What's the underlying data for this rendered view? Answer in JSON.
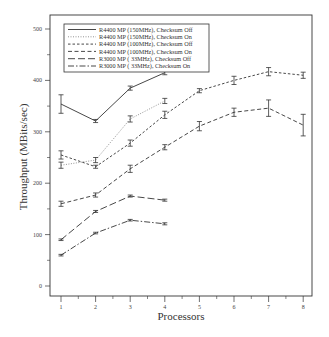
{
  "chart_data": {
    "type": "line",
    "title": "",
    "xlabel": "Processors",
    "ylabel": "Throughput (MBits/sec)",
    "x": [
      1,
      2,
      3,
      4,
      5,
      6,
      7,
      8
    ],
    "xlim": [
      0.8,
      8.2
    ],
    "ylim": [
      -20,
      520
    ],
    "yticks": [
      0,
      100,
      200,
      300,
      400,
      500
    ],
    "xticks": [
      1,
      2,
      3,
      4,
      5,
      6,
      7,
      8
    ],
    "grid": false,
    "legend_position": "upper left",
    "error_bars": true,
    "series": [
      {
        "name": "R4400 MP (150MHz), Checksum Off",
        "style": "solid",
        "x": [
          1,
          2,
          3,
          4
        ],
        "values": [
          354,
          321,
          385,
          415
        ],
        "err": [
          18,
          3,
          4,
          4
        ]
      },
      {
        "name": "R4400 MP (150MHz), Checksum On",
        "style": "dotted",
        "x": [
          1,
          2,
          3,
          4
        ],
        "values": [
          235,
          245,
          325,
          360
        ],
        "err": [
          6,
          5,
          6,
          5
        ]
      },
      {
        "name": "R4400 MP (100MHz), Checksum Off",
        "style": "short-dash",
        "x": [
          1,
          2,
          3,
          4,
          5,
          6,
          7,
          8
        ],
        "values": [
          255,
          232,
          278,
          333,
          380,
          400,
          417,
          410
        ],
        "err": [
          8,
          3,
          6,
          7,
          4,
          8,
          8,
          6
        ]
      },
      {
        "name": "R4400 MP (100MHz), Checksum On",
        "style": "dash",
        "x": [
          1,
          2,
          3,
          4,
          5,
          6,
          7,
          8
        ],
        "values": [
          160,
          177,
          228,
          270,
          311,
          338,
          346,
          313
        ],
        "err": [
          5,
          4,
          7,
          5,
          9,
          8,
          16,
          21
        ]
      },
      {
        "name": "R3000 MP ( 33MHz), Checksum Off",
        "style": "long-dash",
        "x": [
          1,
          2,
          3,
          4
        ],
        "values": [
          90,
          145,
          175,
          167
        ],
        "err": [
          1,
          2,
          2,
          2
        ]
      },
      {
        "name": "R3000 MP ( 33MHz), Checksum On",
        "style": "dash-dot",
        "x": [
          1,
          2,
          3,
          4
        ],
        "values": [
          60,
          103,
          128,
          121
        ],
        "err": [
          1,
          1,
          1,
          2
        ]
      }
    ]
  }
}
